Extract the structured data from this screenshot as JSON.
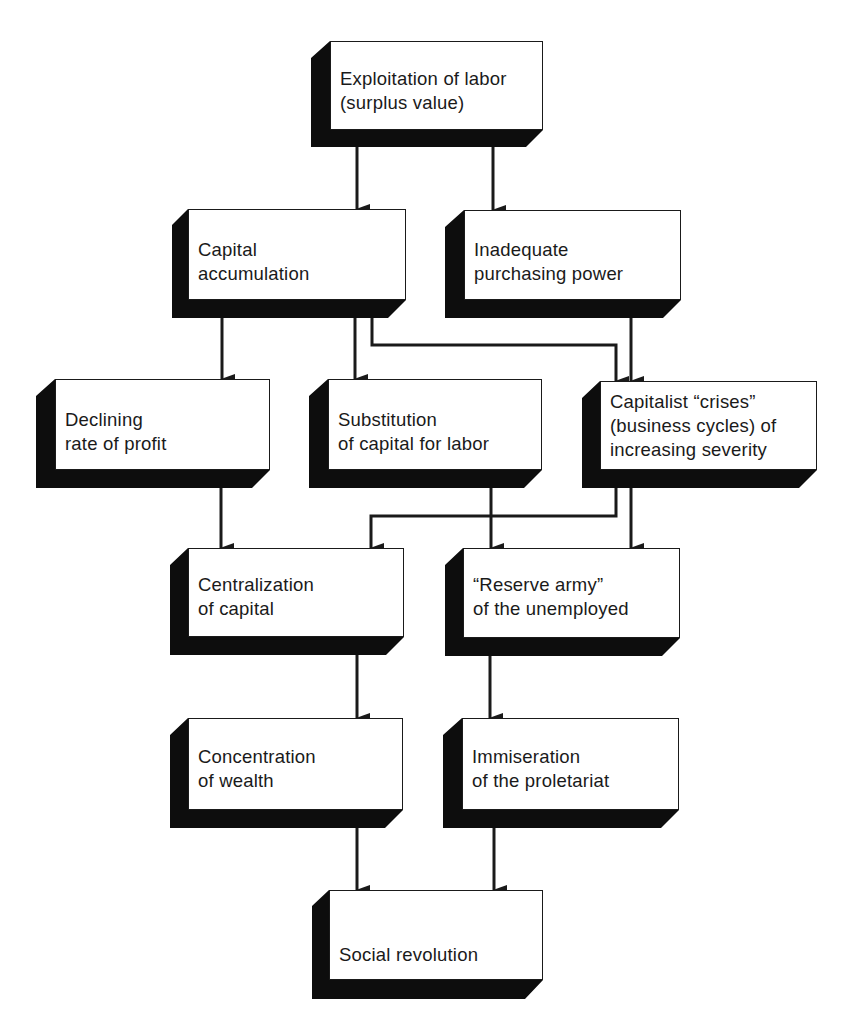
{
  "diagram": {
    "type": "flowchart",
    "theme": {
      "face_color": "#ffffff",
      "shadow_color": "#0d0d0d",
      "line_color": "#1a1a1a"
    },
    "nodes": [
      {
        "id": "exploitation",
        "lines": [
          "Exploitation of labor",
          "(surplus value)"
        ]
      },
      {
        "id": "capital_accumulation",
        "lines": [
          "Capital",
          "accumulation"
        ]
      },
      {
        "id": "inadequate_purchasing",
        "lines": [
          "Inadequate",
          "purchasing power"
        ]
      },
      {
        "id": "declining_profit",
        "lines": [
          "Declining",
          "rate of profit"
        ]
      },
      {
        "id": "substitution",
        "lines": [
          "Substitution",
          "of capital for labor"
        ]
      },
      {
        "id": "crises",
        "lines": [
          "Capitalist “crises”",
          "(business cycles) of",
          "increasing severity"
        ]
      },
      {
        "id": "centralization",
        "lines": [
          "Centralization",
          "of capital"
        ]
      },
      {
        "id": "reserve_army",
        "lines": [
          "“Reserve army”",
          "of the unemployed"
        ]
      },
      {
        "id": "concentration",
        "lines": [
          "Concentration",
          "of wealth"
        ]
      },
      {
        "id": "immiseration",
        "lines": [
          "Immiseration",
          "of the proletariat"
        ]
      },
      {
        "id": "social_revolution",
        "lines": [
          "Social revolution"
        ]
      }
    ],
    "edges": [
      {
        "from": "exploitation",
        "to": "capital_accumulation"
      },
      {
        "from": "exploitation",
        "to": "inadequate_purchasing"
      },
      {
        "from": "capital_accumulation",
        "to": "declining_profit"
      },
      {
        "from": "capital_accumulation",
        "to": "substitution"
      },
      {
        "from": "capital_accumulation",
        "to": "crises"
      },
      {
        "from": "inadequate_purchasing",
        "to": "crises"
      },
      {
        "from": "declining_profit",
        "to": "centralization"
      },
      {
        "from": "crises",
        "to": "centralization"
      },
      {
        "from": "substitution",
        "to": "reserve_army"
      },
      {
        "from": "crises",
        "to": "reserve_army"
      },
      {
        "from": "centralization",
        "to": "concentration"
      },
      {
        "from": "reserve_army",
        "to": "immiseration"
      },
      {
        "from": "concentration",
        "to": "social_revolution"
      },
      {
        "from": "immiseration",
        "to": "social_revolution"
      }
    ]
  }
}
